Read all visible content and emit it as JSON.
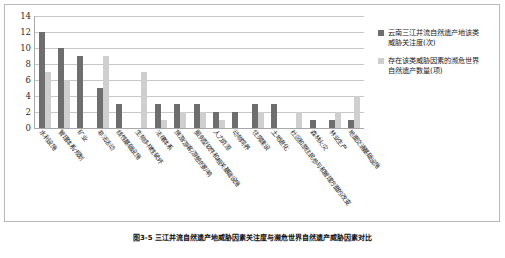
{
  "chart_data": {
    "type": "bar",
    "title": "",
    "xlabel": "",
    "ylabel": "",
    "ylim": [
      0,
      14
    ],
    "yticks": [
      0,
      2,
      4,
      6,
      8,
      10,
      12,
      14
    ],
    "grid": true,
    "legend_position": "right",
    "categories": [
      "水利设施",
      "管理体系/规划",
      "矿业",
      "非法活动",
      "线性基础设施",
      "生物多样性破坏",
      "法律体系",
      "旅游/游客/游憩的影响",
      "服务型软件和相关基础设施",
      "人力资源",
      "动物饲养",
      "住房建设",
      "土地退化",
      "社区和原住民参与和管理方面的改变",
      "森林火灾",
      "林业生产",
      "地面交通基础设施"
    ],
    "series": [
      {
        "name": "云南三江并流自然遗产地该类威胁关注度(次)",
        "color": "#6e6e6e",
        "values": [
          12,
          10,
          9,
          5,
          3,
          0,
          3,
          3,
          3,
          2,
          2,
          3,
          3,
          0,
          1,
          1,
          1
        ]
      },
      {
        "name": "存在该类威胁因素的濒危世界自然遗产数量(项)",
        "color": "#cfcfcf",
        "values": [
          7,
          6,
          0,
          9,
          0,
          7,
          1,
          2,
          2,
          1,
          0,
          2,
          0,
          2,
          0,
          2,
          4
        ]
      }
    ]
  },
  "legend": {
    "items": [
      {
        "label": "云南三江并流自然遗产地该类威胁关注度(次)",
        "swatch": "s0"
      },
      {
        "label": "存在该类威胁因素的濒危世界自然遗产数量(项)",
        "swatch": "s1"
      }
    ]
  },
  "caption": {
    "text": "图3-5 三江并流自然遗产地威胁因素关注度与濒危世界自然遗产威胁因素对比"
  },
  "colors": {
    "series0": "#6e6e6e",
    "series1": "#cfcfcf",
    "grid": "#c8c8c8",
    "axis": "#a8a8a8",
    "frame": "#b9b9b9",
    "text": "#1b1b1b",
    "background": "#ffffff"
  }
}
